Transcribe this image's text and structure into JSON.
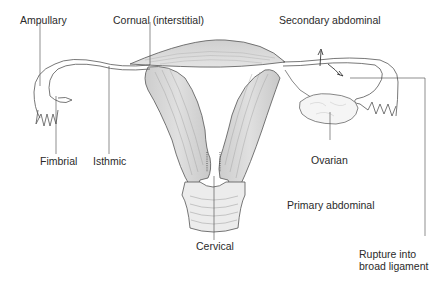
{
  "figure": {
    "labels": {
      "ampullary": "Ampullary",
      "cornual": "Cornual (interstitial)",
      "secondary_abdominal": "Secondary abdominal",
      "fimbrial": "Fimbrial",
      "isthmic": "Isthmic",
      "ovarian": "Ovarian",
      "primary_abdominal": "Primary abdominal",
      "cervical": "Cervical",
      "rupture_line1": "Rupture into",
      "rupture_line2": "broad ligament"
    },
    "colors": {
      "tissue_fill": "#d9d9d9",
      "outline": "#555555",
      "leader_line": "#444444",
      "text": "#2a2a2a"
    }
  }
}
